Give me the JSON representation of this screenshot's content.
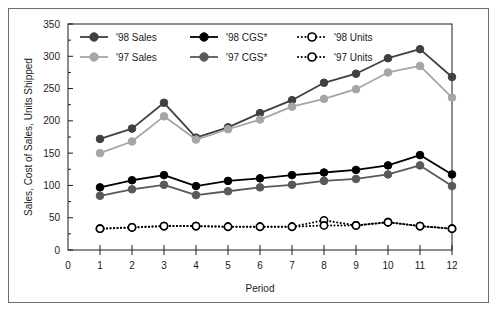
{
  "chart_data": {
    "type": "line",
    "title": "",
    "xlabel": "Period",
    "ylabel": "Sales, Cost of Sales, Units Shipped",
    "xlim": [
      0,
      12
    ],
    "ylim": [
      0,
      350
    ],
    "x_ticks": [
      0,
      1,
      2,
      3,
      4,
      5,
      6,
      7,
      8,
      9,
      10,
      11,
      12
    ],
    "y_ticks": [
      0,
      50,
      100,
      150,
      200,
      250,
      300,
      350
    ],
    "y_minor_ticks": [
      25,
      75,
      125,
      175,
      225,
      275,
      325
    ],
    "grid": false,
    "legend_position": "top-inside",
    "x": [
      1,
      2,
      3,
      4,
      5,
      6,
      7,
      8,
      9,
      10,
      11,
      12
    ],
    "categories": [
      "1",
      "2",
      "3",
      "4",
      "5",
      "6",
      "7",
      "8",
      "9",
      "10",
      "11",
      "12"
    ],
    "series": [
      {
        "name": "'98 Sales",
        "color": "#404040",
        "marker": "filled-circle",
        "line_style": "solid",
        "values": [
          172,
          188,
          228,
          174,
          190,
          212,
          232,
          259,
          273,
          297,
          311,
          268
        ]
      },
      {
        "name": "'97 Sales",
        "color": "#a6a6a6",
        "marker": "filled-circle",
        "line_style": "solid",
        "values": [
          150,
          168,
          207,
          171,
          187,
          202,
          222,
          234,
          249,
          275,
          285,
          236
        ]
      },
      {
        "name": "'98 CGS*",
        "color": "#000000",
        "marker": "filled-circle",
        "line_style": "solid",
        "values": [
          97,
          108,
          116,
          99,
          107,
          111,
          116,
          120,
          124,
          131,
          147,
          117
        ]
      },
      {
        "name": "'97 CGS*",
        "color": "#595959",
        "marker": "filled-circle",
        "line_style": "solid",
        "values": [
          84,
          94,
          101,
          85,
          91,
          97,
          101,
          107,
          110,
          117,
          131,
          99
        ]
      },
      {
        "name": "'98 Units",
        "color": "#000000",
        "marker": "open-circle",
        "line_style": "dotted",
        "values": [
          33,
          35,
          37,
          37,
          36,
          36,
          36,
          46,
          38,
          43,
          37,
          33
        ]
      },
      {
        "name": "'97 Units",
        "color": "#000000",
        "marker": "open-circle",
        "line_style": "dotted",
        "values": [
          33,
          35,
          37,
          37,
          36,
          36,
          36,
          38,
          38,
          43,
          37,
          33
        ]
      }
    ],
    "legend": [
      {
        "label": "'98 Sales",
        "color": "#404040",
        "marker": "filled-circle",
        "line_style": "solid"
      },
      {
        "label": "'98 CGS*",
        "color": "#000000",
        "marker": "filled-circle",
        "line_style": "solid"
      },
      {
        "label": "'98 Units",
        "color": "#000000",
        "marker": "open-circle",
        "line_style": "dotted"
      },
      {
        "label": "'97 Sales",
        "color": "#a6a6a6",
        "marker": "filled-circle",
        "line_style": "solid"
      },
      {
        "label": "'97 CGS*",
        "color": "#595959",
        "marker": "filled-circle",
        "line_style": "solid"
      },
      {
        "label": "'97 Units",
        "color": "#000000",
        "marker": "open-circle",
        "line_style": "dotted"
      }
    ]
  },
  "colors": {
    "frame": "#6e6e6e",
    "axis": "#1a1a1a",
    "background": "#ffffff"
  }
}
